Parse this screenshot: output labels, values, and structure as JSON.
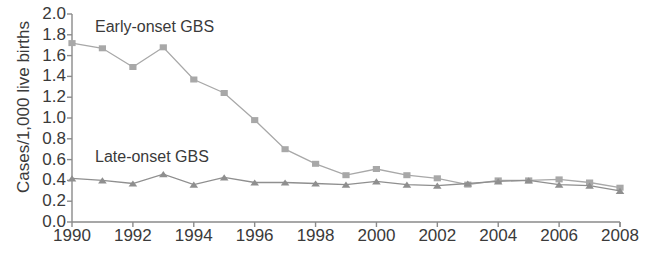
{
  "chart_data": {
    "type": "line",
    "title": "",
    "xlabel": "",
    "ylabel": "Cases/1,000 live births",
    "xlim": [
      1990,
      2008
    ],
    "ylim": [
      0.0,
      2.0
    ],
    "grid": false,
    "legend_position": "inline-annotation",
    "x": [
      1990,
      1991,
      1992,
      1993,
      1994,
      1995,
      1996,
      1997,
      1998,
      1999,
      2000,
      2001,
      2002,
      2003,
      2004,
      2005,
      2006,
      2007,
      2008
    ],
    "xticks": [
      "1990",
      "1992",
      "1994",
      "1996",
      "1998",
      "2000",
      "2002",
      "2004",
      "2006",
      "2008"
    ],
    "yticks": [
      "0.0",
      "0.2",
      "0.4",
      "0.6",
      "0.8",
      "1.0",
      "1.2",
      "1.4",
      "1.6",
      "1.8",
      "2.0"
    ],
    "series": [
      {
        "name": "Early-onset GBS",
        "marker": "square",
        "color": "#a8a8a8",
        "values": [
          1.72,
          1.67,
          1.49,
          1.68,
          1.37,
          1.24,
          0.98,
          0.7,
          0.56,
          0.45,
          0.51,
          0.45,
          0.42,
          0.36,
          0.4,
          0.4,
          0.41,
          0.38,
          0.33
        ]
      },
      {
        "name": "Late-onset GBS",
        "marker": "triangle",
        "color": "#8f8f8f",
        "values": [
          0.42,
          0.4,
          0.37,
          0.46,
          0.36,
          0.43,
          0.38,
          0.38,
          0.37,
          0.36,
          0.39,
          0.36,
          0.35,
          0.37,
          0.39,
          0.4,
          0.36,
          0.35,
          0.3
        ]
      }
    ],
    "annotations": [
      {
        "text": "Early-onset GBS",
        "x_px": 95,
        "y_px": 18
      },
      {
        "text": "Late-onset GBS",
        "x_px": 95,
        "y_px": 148
      }
    ]
  },
  "axis": {
    "color": "#8a8a8a"
  }
}
